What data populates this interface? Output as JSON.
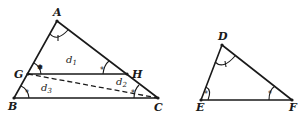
{
  "diagram": {
    "type": "geometry-similar-triangles",
    "triangles": [
      {
        "name": "ABC",
        "vertices": [
          "A",
          "B",
          "C"
        ]
      },
      {
        "name": "DEF",
        "vertices": [
          "D",
          "E",
          "F"
        ]
      }
    ],
    "points": {
      "A": "A",
      "B": "B",
      "C": "C",
      "G": "G",
      "H": "H",
      "D": "D",
      "E": "E",
      "F": "F"
    },
    "segment_labels": {
      "d1": {
        "base": "d",
        "sub": "1"
      },
      "d2": {
        "base": "d",
        "sub": "2"
      },
      "d3": {
        "base": "d",
        "sub": "3"
      }
    },
    "relations": [
      "GH parallel to BC",
      "GC dashed diagonal",
      "angle A = angle D (single tick)",
      "angle AGH = angle GBC = angle E (asterisk mark)",
      "angle AHG = angle GCB = angle F (asterisk mark)"
    ],
    "angle_marks": {
      "single_tick": [
        "A",
        "D"
      ],
      "asterisk": [
        "G-upper",
        "B",
        "H",
        "C",
        "E",
        "F"
      ]
    }
  }
}
